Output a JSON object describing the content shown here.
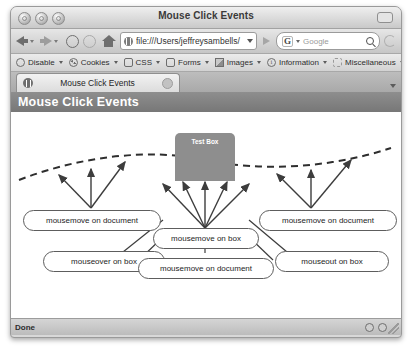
{
  "window": {
    "title": "Mouse Click Events",
    "traffic_lights": [
      "close",
      "minimize",
      "zoom"
    ]
  },
  "navbar": {
    "back_label": "Back",
    "forward_label": "Forward",
    "reload_label": "Reload",
    "stop_label": "Stop",
    "home_label": "Home",
    "url": "file:///Users/jeffreysambells/",
    "go_label": "Go",
    "search_engine": "G",
    "search_placeholder": "Google"
  },
  "devbar": {
    "items": [
      {
        "label": "Disable",
        "icon": "disable-icon"
      },
      {
        "label": "Cookies",
        "icon": "cookies-icon"
      },
      {
        "label": "CSS",
        "icon": "css-icon"
      },
      {
        "label": "Forms",
        "icon": "forms-icon"
      },
      {
        "label": "Images",
        "icon": "images-icon"
      },
      {
        "label": "Information",
        "icon": "information-icon"
      },
      {
        "label": "Miscellaneous",
        "icon": "miscellaneous-icon"
      }
    ]
  },
  "tabbar": {
    "tabs": [
      {
        "title": "Mouse Click Events"
      }
    ]
  },
  "page": {
    "header_title": "Mouse Click Events",
    "test_box_label": "Test Box",
    "callouts": [
      {
        "id": "left-document",
        "label": "mousemove on document"
      },
      {
        "id": "left-mouseover",
        "label": "mouseover on box"
      },
      {
        "id": "center-box",
        "label": "mousemove on box"
      },
      {
        "id": "center-document",
        "label": "mousemove on document"
      },
      {
        "id": "right-document",
        "label": "mousemove on document"
      },
      {
        "id": "right-mouseout",
        "label": "mouseout on box"
      }
    ]
  },
  "statusbar": {
    "text": "Done"
  },
  "colors": {
    "page_header": "#808080",
    "test_box": "#8e8e8e",
    "line": "#3d3d3d"
  }
}
